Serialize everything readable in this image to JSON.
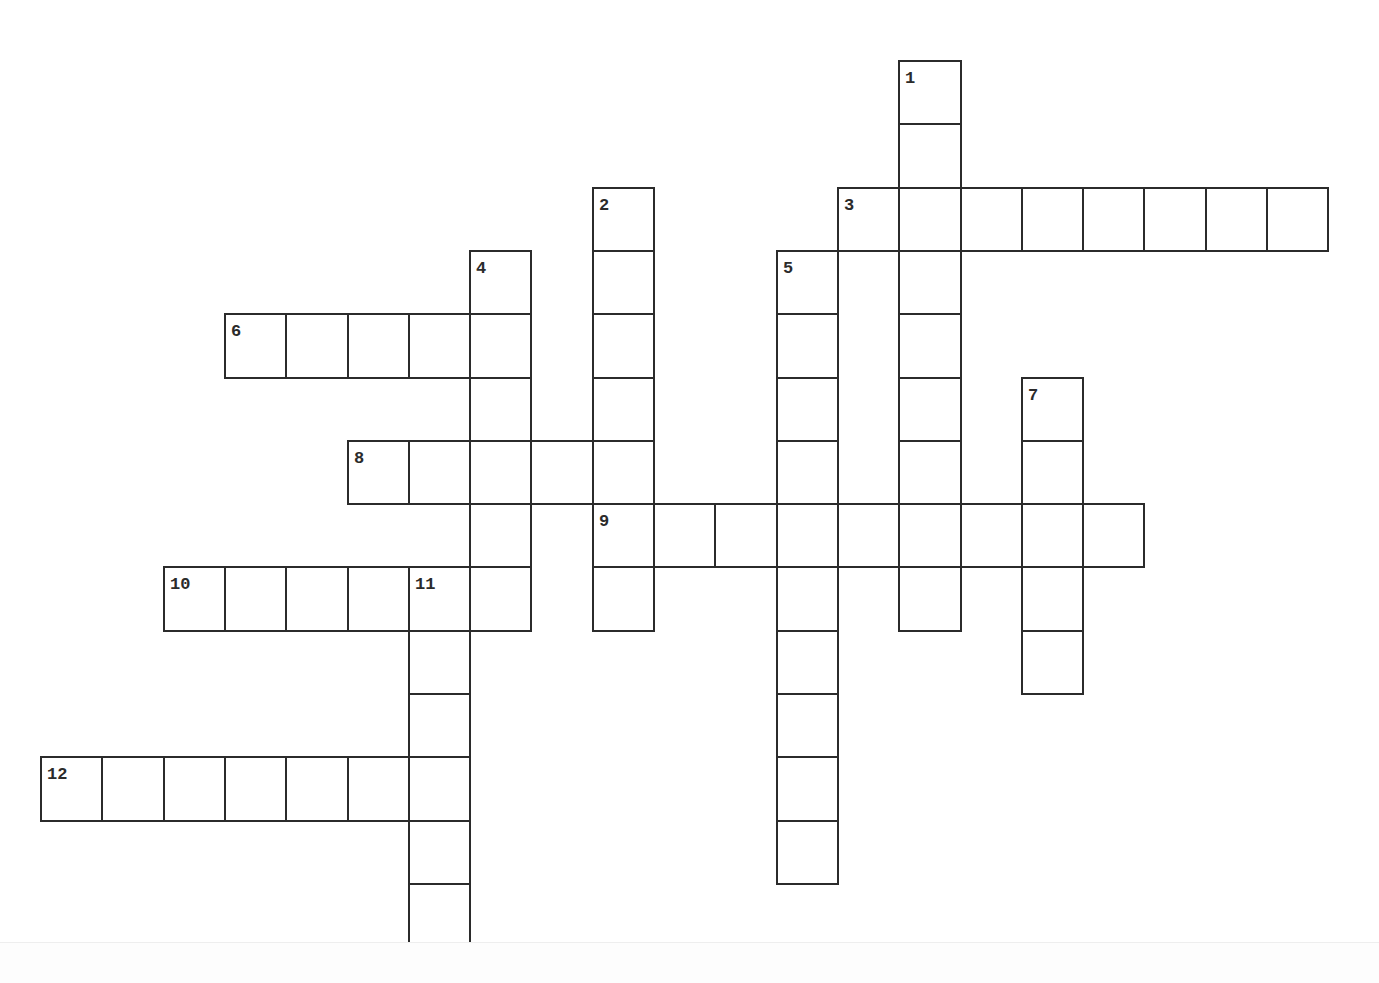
{
  "header": {
    "instruction_text": ""
  },
  "puzzle": {
    "type": "crossword",
    "style": {
      "line_color": "#2b2b2b",
      "cell_fill": "#ffffff",
      "background": "#ffffff"
    },
    "layout": {
      "origin_x": 40,
      "origin_y": 60,
      "cell_w": 61.3,
      "cell_h": 63.3
    },
    "entries": [
      {
        "number": "1",
        "direction": "down",
        "row": 0,
        "col": 14,
        "length": 9
      },
      {
        "number": "2",
        "direction": "down",
        "row": 2,
        "col": 9,
        "length": 7
      },
      {
        "number": "3",
        "direction": "across",
        "row": 2,
        "col": 13,
        "length": 8
      },
      {
        "number": "4",
        "direction": "down",
        "row": 3,
        "col": 7,
        "length": 6
      },
      {
        "number": "5",
        "direction": "down",
        "row": 3,
        "col": 12,
        "length": 10
      },
      {
        "number": "6",
        "direction": "across",
        "row": 4,
        "col": 3,
        "length": 5
      },
      {
        "number": "7",
        "direction": "down",
        "row": 5,
        "col": 16,
        "length": 5
      },
      {
        "number": "8",
        "direction": "across",
        "row": 6,
        "col": 5,
        "length": 5
      },
      {
        "number": "9",
        "direction": "across",
        "row": 7,
        "col": 9,
        "length": 9
      },
      {
        "number": "10",
        "direction": "across",
        "row": 8,
        "col": 2,
        "length": 6
      },
      {
        "number": "11",
        "direction": "down",
        "row": 8,
        "col": 6,
        "length": 6
      },
      {
        "number": "12",
        "direction": "across",
        "row": 11,
        "col": 0,
        "length": 7
      }
    ]
  }
}
